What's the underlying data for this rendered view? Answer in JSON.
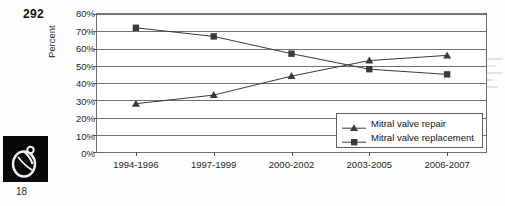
{
  "page": {
    "page_number": "292",
    "figure_number": "18",
    "logo_icon": "stylized-monogram-logo"
  },
  "chart_data": {
    "type": "line",
    "title": "",
    "xlabel": "",
    "ylabel": "Percent",
    "categories": [
      "1994-1996",
      "1997-1999",
      "2000-2002",
      "2003-2005",
      "2006-2007"
    ],
    "ylim": [
      0,
      80
    ],
    "ytick_step": 10,
    "ytick_labels": [
      "0%",
      "10%",
      "20%",
      "30%",
      "40%",
      "50%",
      "60%",
      "70%",
      "80%"
    ],
    "grid": true,
    "legend_position": "lower-right-inside",
    "series": [
      {
        "name": "Mitral valve repair",
        "marker": "triangle",
        "color": "#3a3a3a",
        "values": [
          28,
          33,
          44,
          53,
          56
        ]
      },
      {
        "name": "Mitral valve replacement",
        "marker": "square",
        "color": "#3a3a3a",
        "values": [
          72,
          67,
          57,
          48,
          45
        ]
      }
    ]
  }
}
